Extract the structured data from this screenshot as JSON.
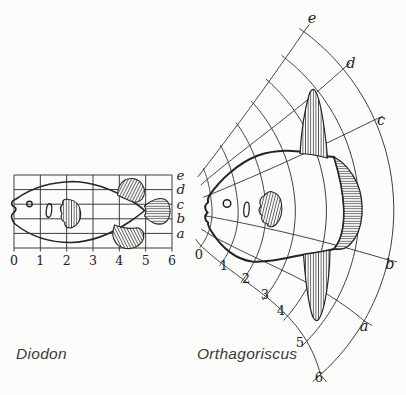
{
  "palette": {
    "ink": "#2a2a2a",
    "grid": "#343434",
    "background": "#fcfcfb"
  },
  "left_figure": {
    "caption": "Diodon",
    "x_tick_labels": [
      "0",
      "1",
      "2",
      "3",
      "4",
      "5",
      "6"
    ],
    "row_labels": [
      "e",
      "d",
      "c",
      "b",
      "a"
    ]
  },
  "right_figure": {
    "caption": "Orthagoriscus",
    "arc_tick_labels": [
      "0",
      "1",
      "2",
      "3",
      "4",
      "5",
      "6"
    ],
    "ray_labels": [
      "e",
      "d",
      "c",
      "b",
      "a"
    ]
  }
}
